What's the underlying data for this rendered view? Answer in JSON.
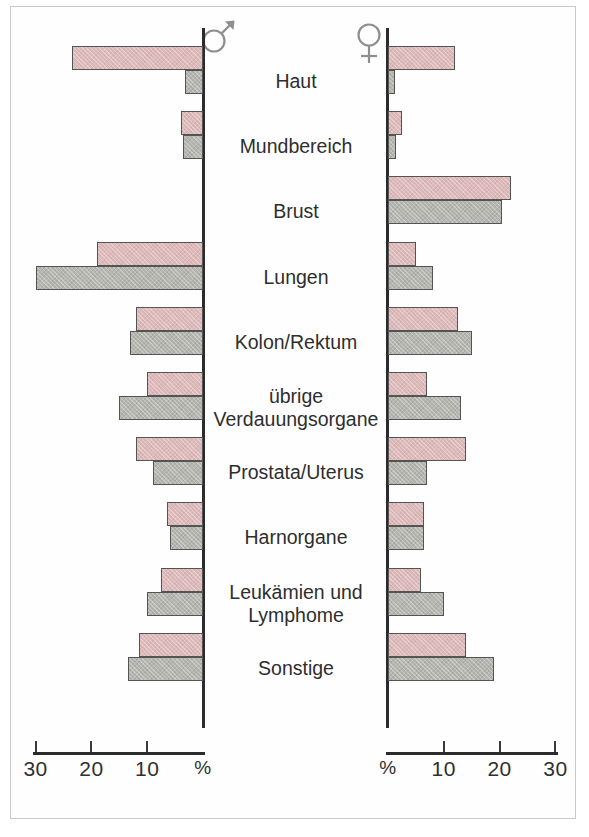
{
  "figure": {
    "male_symbol_name": "mars-symbol",
    "female_symbol_name": "venus-symbol",
    "percent_symbol": "%"
  },
  "axes": {
    "left": {
      "ticks": [
        "30",
        "20",
        "10",
        "%"
      ],
      "tick_values": [
        30,
        20,
        10,
        0
      ],
      "max": 30,
      "direction": "right-to-left"
    },
    "right": {
      "ticks": [
        "%",
        "10",
        "20",
        "30"
      ],
      "tick_values": [
        0,
        10,
        20,
        30
      ],
      "max": 30,
      "direction": "left-to-right"
    }
  },
  "legend": {
    "pink_color": "#ddb9b9",
    "gray_color": "#b6b6b1",
    "outline_color": "#545454"
  },
  "chart_data": {
    "type": "bar",
    "orientation": "horizontal",
    "layout": "back-to-back population pyramid",
    "xlabel": "%",
    "ylabel": "",
    "xlim": [
      0,
      30
    ],
    "grid": false,
    "legend_position": "none",
    "categories": [
      "Haut",
      "Mundbereich",
      "Brust",
      "Lungen",
      "Kolon/Rektum",
      "übrige Verdauungsorgane",
      "Prostata/Uterus",
      "Harnorgane",
      "Leukämien und Lymphome",
      "Sonstige"
    ],
    "panels": [
      {
        "name": "Männer",
        "symbol": "♂",
        "side": "left",
        "series": [
          {
            "name": "Neuerkrankungen",
            "color": "#ddb9b9",
            "values": [
              23.5,
              4.0,
              0.0,
              19.0,
              12.0,
              10.0,
              12.0,
              6.5,
              7.5,
              11.5
            ]
          },
          {
            "name": "Sterbefälle",
            "color": "#b6b6b1",
            "values": [
              3.2,
              3.5,
              0.0,
              30.0,
              13.0,
              15.0,
              9.0,
              6.0,
              10.0,
              13.5
            ]
          }
        ]
      },
      {
        "name": "Frauen",
        "symbol": "♀",
        "side": "right",
        "series": [
          {
            "name": "Neuerkrankungen",
            "color": "#ddb9b9",
            "values": [
              12.0,
              2.5,
              22.0,
              5.0,
              12.5,
              7.0,
              14.0,
              6.5,
              6.0,
              14.0
            ]
          },
          {
            "name": "Sterbefälle",
            "color": "#b6b6b1",
            "values": [
              1.2,
              1.5,
              20.5,
              8.0,
              15.0,
              13.0,
              7.0,
              6.5,
              10.0,
              19.0
            ]
          }
        ]
      }
    ]
  }
}
